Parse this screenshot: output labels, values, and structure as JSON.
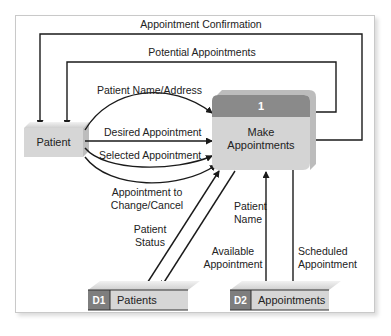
{
  "colors": {
    "entity_fill": "#d6d6d6",
    "process_header": "#8a8a8a",
    "process_body": "#d4d4d4",
    "store_id_fill": "#7e7e7e",
    "store_body": "#d6d6d6",
    "line": "#1a1a1a"
  },
  "entity": {
    "label": "Patient"
  },
  "process": {
    "id": "1",
    "label_line1": "Make",
    "label_line2": "Appointments"
  },
  "data_stores": [
    {
      "id": "D1",
      "label": "Patients"
    },
    {
      "id": "D2",
      "label": "Appointments"
    }
  ],
  "flows": {
    "appointment_confirmation": "Appointment Confirmation",
    "potential_appointments": "Potential Appointments",
    "patient_name_address": "Patient Name/Address",
    "desired_appointment": "Desired Appointment",
    "selected_appointment": "Selected Appointment",
    "appointment_to_change_line1": "Appointment to",
    "appointment_to_change_line2": "Change/Cancel",
    "patient_status_line1": "Patient",
    "patient_status_line2": "Status",
    "patient_name_line1": "Patient",
    "patient_name_line2": "Name",
    "available_appointment_line1": "Available",
    "available_appointment_line2": "Appointment",
    "scheduled_appointment_line1": "Scheduled",
    "scheduled_appointment_line2": "Appointment"
  }
}
